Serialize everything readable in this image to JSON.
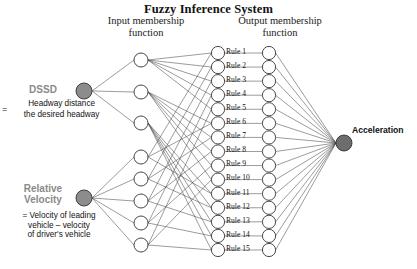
{
  "diagram": {
    "title": "Fuzzy Inference System",
    "type": "fuzzy-inference-network",
    "background": "#ffffff",
    "columns": {
      "input_membership_heading": "Input  membership\nfunction",
      "input_membership_heading_line1": "Input  membership",
      "input_membership_heading_line2": "function",
      "output_membership_heading_line1": "Output  membership",
      "output_membership_heading_line2": "function"
    },
    "inputs": [
      {
        "id": "dssd",
        "label": "DSSD",
        "label_color": "#8a8a8a",
        "equals_sign": "=",
        "definition_numerator": "Headway distance",
        "definition_denominator": "the desired headway",
        "node": {
          "cx": 84,
          "cy": 91,
          "r": 8,
          "fill": "#8c8c8c",
          "stroke": "#333333"
        },
        "membership_count": 3
      },
      {
        "id": "relative-velocity",
        "label_line1": "Relative",
        "label_line2": "Velocity",
        "label_color": "#8a8a8a",
        "definition": "= Velocity of leading vehicle – velocity of driver's vehicle",
        "definition_line1": "= Velocity of leading",
        "definition_line2": "vehicle – velocity",
        "definition_line3": "of driver's vehicle",
        "node": {
          "cx": 84,
          "cy": 198,
          "r": 8,
          "fill": "#8c8c8c",
          "stroke": "#333333"
        },
        "membership_count": 5
      }
    ],
    "input_membership_nodes": {
      "cx": 141,
      "r": 7,
      "fill": "#ffffff",
      "stroke": "#333333",
      "group_dssd_cy": [
        60,
        92,
        123
      ],
      "group_relvel_cy": [
        157,
        179,
        201,
        223,
        245
      ]
    },
    "rules": {
      "cx": 218,
      "r": 6.6,
      "fill": "#ffffff",
      "stroke": "#333333",
      "label_x": 226,
      "first_cy": 53,
      "spacing": 14.07,
      "items": [
        {
          "label": "Rule 1"
        },
        {
          "label": "Rule 2"
        },
        {
          "label": "Rule 3"
        },
        {
          "label": "Rule 4"
        },
        {
          "label": "Rule 5"
        },
        {
          "label": "Rule 6"
        },
        {
          "label": "Rule 7"
        },
        {
          "label": "Rule 8"
        },
        {
          "label": "Rule 9"
        },
        {
          "label": "Rule 10"
        },
        {
          "label": "Rule 11"
        },
        {
          "label": "Rule 12"
        },
        {
          "label": "Rule 13"
        },
        {
          "label": "Rule 14"
        },
        {
          "label": "Rule 15"
        }
      ]
    },
    "output_membership_nodes": {
      "cx": 269,
      "r": 6.6,
      "fill": "#ffffff",
      "stroke": "#333333",
      "count": 15
    },
    "output": {
      "label": "Acceleration",
      "node": {
        "cx": 344,
        "cy": 143,
        "r": 8,
        "fill": "#6d6d6d",
        "stroke": "#333333"
      }
    },
    "edge_color": "#4a4a4a"
  }
}
